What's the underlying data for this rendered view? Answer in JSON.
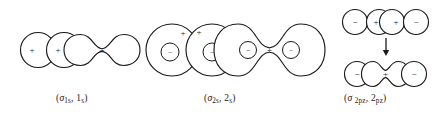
{
  "figure": {
    "background_color": "#ffffff",
    "stroke_color": "#1a1a1a",
    "width": 446,
    "height": 117
  },
  "panels": [
    {
      "id": "sigma-1s",
      "caption_prefix": "(",
      "caption_sigma": "σ",
      "caption_sub1": "1s",
      "caption_mid": ", 1",
      "caption_sub2": "s",
      "caption_suffix": ")",
      "caption_plain": "(σ1s, 1s)",
      "arrow_direction": "right",
      "reactant_lobes": [
        {
          "sign": "+",
          "label": "1s-orbital-left"
        },
        {
          "sign": "+",
          "label": "1s-orbital-right"
        }
      ],
      "product_lobes": [
        {
          "sign": "+",
          "label": "sigma-1s-bonding-orbital"
        }
      ]
    },
    {
      "id": "sigma-2s",
      "caption_prefix": "(",
      "caption_sigma": "σ",
      "caption_sub1": "2s",
      "caption_mid": ", 2",
      "caption_sub2": "s",
      "caption_suffix": ")",
      "caption_plain": "(σ2s, 2s)",
      "arrow_direction": "right",
      "reactant_lobes": [
        {
          "sign": "+",
          "inner_sign": "−",
          "label": "2s-orbital-left"
        },
        {
          "sign": "+",
          "inner_sign": "−",
          "label": "2s-orbital-right"
        }
      ],
      "product_lobes": [
        {
          "sign": "+",
          "inner_signs": [
            "−",
            "−"
          ],
          "label": "sigma-2s-bonding-orbital"
        }
      ]
    },
    {
      "id": "sigma-2pz",
      "caption_prefix": "(",
      "caption_sigma": "σ",
      "caption_sub1": "2pz",
      "caption_mid": ", 2",
      "caption_sub2": "pz",
      "caption_suffix": ")",
      "caption_plain": "(σ 2pz, 2pz)",
      "arrow_direction": "down",
      "reactant_lobes": [
        {
          "sign": "−",
          "label": "2pz-left-outer-lobe"
        },
        {
          "sign": "+",
          "label": "2pz-left-inner-lobe"
        },
        {
          "sign": "+",
          "label": "2pz-right-inner-lobe"
        },
        {
          "sign": "−",
          "label": "2pz-right-outer-lobe"
        }
      ],
      "product_lobes": [
        {
          "sign": "−",
          "label": "sigma-2pz-left-lobe"
        },
        {
          "sign": "+",
          "label": "sigma-2pz-center-lobe"
        },
        {
          "sign": "−",
          "label": "sigma-2pz-right-lobe"
        }
      ]
    }
  ],
  "glyphs": {
    "plus": "+",
    "minus": "−"
  }
}
